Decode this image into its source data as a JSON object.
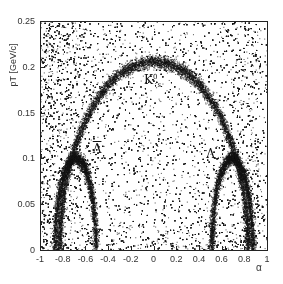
{
  "chart_data": {
    "type": "scatter",
    "title": "",
    "xlabel": "α",
    "ylabel": "pT [GeV/c]",
    "xlim": [
      -1,
      1
    ],
    "ylim": [
      0,
      0.25
    ],
    "grid": false,
    "legend": null,
    "x_ticks": [
      "-1",
      "-0.8",
      "-0.6",
      "-0.4",
      "-0.2",
      "0",
      "0.2",
      "0.4",
      "0.6",
      "0.8",
      "1"
    ],
    "y_ticks": [
      "0",
      "0.05",
      "0.1",
      "0.15",
      "0.2",
      "0.25"
    ],
    "annotations": [
      {
        "label": "K0s",
        "text_main": "K",
        "sup": "0",
        "sub": "s",
        "x": -0.03,
        "y": 0.185
      },
      {
        "label": "Λ",
        "text_main": "Λ",
        "x": 0.5,
        "y": 0.105
      },
      {
        "label": "anti-Λ",
        "text_main": "Λ",
        "overline": true,
        "x": -0.5,
        "y": 0.11
      }
    ],
    "bands": [
      {
        "name": "K0s",
        "shape": "ellipse",
        "center_alpha": 0.0,
        "half_width_alpha": 0.83,
        "pt_max": 0.206
      },
      {
        "name": "Lambda",
        "shape": "ellipse",
        "center_alpha": 0.69,
        "half_width_alpha": 0.18,
        "pt_max": 0.101
      },
      {
        "name": "anti-Lambda",
        "shape": "ellipse",
        "center_alpha": -0.69,
        "half_width_alpha": 0.18,
        "pt_max": 0.101
      }
    ],
    "background": "dense random scatter over full range, densest near α=±1 edges and top-left"
  },
  "axis": {
    "ylabel": "pT [GeV/c]",
    "xlabel": "α"
  }
}
